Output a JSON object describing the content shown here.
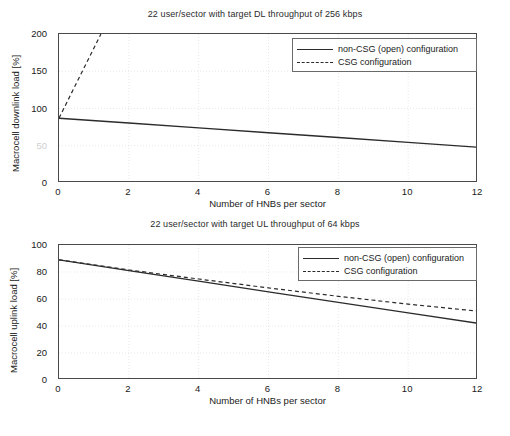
{
  "figure": {
    "panels": [
      {
        "id": "downlink",
        "title": "22 user/sector with target DL throughput of 256 kbps",
        "xlabel": "Number of HNBs per sector",
        "ylabel": "Macrocell downlink load [%]",
        "yticks": [
          "0",
          "50",
          "100",
          "150",
          "200"
        ],
        "ytick_values": [
          0,
          50,
          100,
          150,
          200
        ],
        "xticks": [
          "0",
          "2",
          "4",
          "6",
          "8",
          "10",
          "12"
        ],
        "xtick_values": [
          0,
          2,
          4,
          6,
          8,
          10,
          12
        ],
        "legend": [
          {
            "label": "non-CSG (open) configuration",
            "style": "solid"
          },
          {
            "label": "CSG configuration",
            "style": "dashed"
          }
        ]
      },
      {
        "id": "uplink",
        "title": "22 user/sector with target UL throughput of 64 kbps",
        "xlabel": "Number of HNBs per sector",
        "ylabel": "Macrocell uplink load [%]",
        "yticks": [
          "0",
          "20",
          "40",
          "60",
          "80",
          "100"
        ],
        "ytick_values": [
          0,
          20,
          40,
          60,
          80,
          100
        ],
        "xticks": [
          "0",
          "2",
          "4",
          "6",
          "8",
          "10",
          "12"
        ],
        "xtick_values": [
          0,
          2,
          4,
          6,
          8,
          10,
          12
        ],
        "legend": [
          {
            "label": "non-CSG (open) configuration",
            "style": "solid"
          },
          {
            "label": "CSG configuration",
            "style": "dashed"
          }
        ]
      }
    ]
  },
  "chart_data": [
    {
      "type": "line",
      "id": "downlink",
      "title": "22 user/sector with target DL throughput of 256 kbps",
      "xlabel": "Number of HNBs per sector",
      "ylabel": "Macrocell downlink load [%]",
      "xlim": [
        0,
        12
      ],
      "ylim": [
        0,
        200
      ],
      "xticks": [
        0,
        2,
        4,
        6,
        8,
        10,
        12
      ],
      "yticks": [
        0,
        50,
        100,
        150,
        200
      ],
      "grid": true,
      "legend_position": "upper right",
      "series": [
        {
          "name": "non-CSG (open) configuration",
          "style": "solid",
          "color": "#2b2b2b",
          "x": [
            0,
            2,
            4,
            6,
            8,
            10,
            12
          ],
          "y": [
            87,
            80.5,
            74,
            67.5,
            61,
            54.5,
            48
          ]
        },
        {
          "name": "CSG configuration",
          "style": "dashed",
          "color": "#2b2b2b",
          "x": [
            0,
            0.4,
            0.8,
            1.2
          ],
          "y": [
            87,
            124.7,
            162.3,
            200
          ],
          "note": "rises steeply off the top of the axes beyond x = 1.2"
        }
      ]
    },
    {
      "type": "line",
      "id": "uplink",
      "title": "22 user/sector with target UL throughput of 64 kbps",
      "xlabel": "Number of HNBs per sector",
      "ylabel": "Macrocell uplink load [%]",
      "xlim": [
        0,
        12
      ],
      "ylim": [
        0,
        100
      ],
      "xticks": [
        0,
        2,
        4,
        6,
        8,
        10,
        12
      ],
      "yticks": [
        0,
        20,
        40,
        60,
        80,
        100
      ],
      "grid": true,
      "legend_position": "upper right",
      "series": [
        {
          "name": "non-CSG (open) configuration",
          "style": "solid",
          "color": "#2b2b2b",
          "x": [
            0,
            2,
            4,
            6,
            8,
            10,
            12
          ],
          "y": [
            89,
            81,
            73.2,
            65.3,
            57.5,
            49.7,
            42
          ]
        },
        {
          "name": "CSG configuration",
          "style": "dashed",
          "color": "#2b2b2b",
          "x": [
            0,
            2,
            4,
            6,
            8,
            10,
            12
          ],
          "y": [
            89,
            81.5,
            74.8,
            68.2,
            62,
            56.2,
            51
          ]
        }
      ]
    }
  ]
}
